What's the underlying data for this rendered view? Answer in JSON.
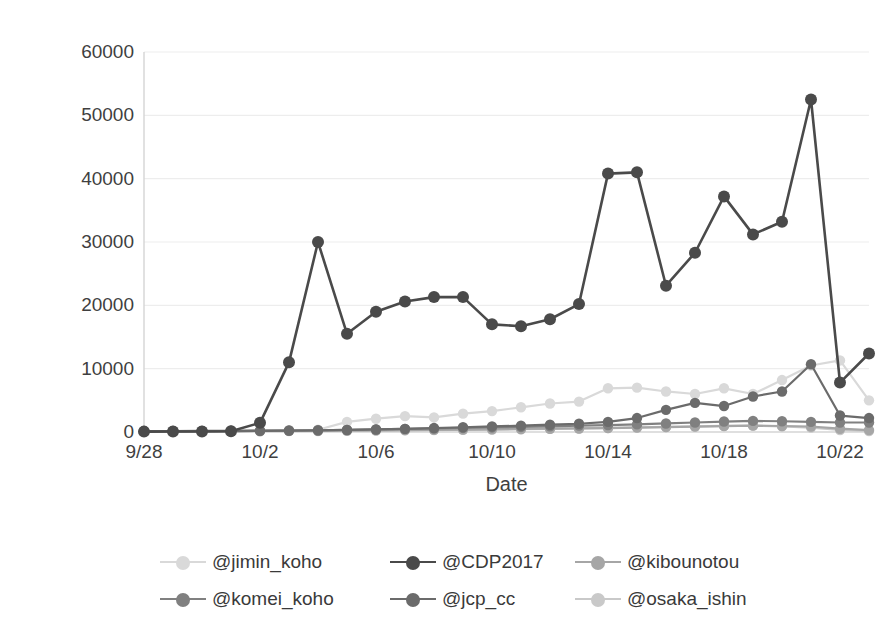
{
  "chart_data": {
    "type": "line",
    "title": "",
    "xlabel": "Date",
    "ylabel": "The number of retweeted",
    "ylim": [
      0,
      60000
    ],
    "ytick_values": [
      0,
      10000,
      20000,
      30000,
      40000,
      50000,
      60000
    ],
    "ytick_labels": [
      "0",
      "10000",
      "20000",
      "30000",
      "40000",
      "50000",
      "60000"
    ],
    "grid": true,
    "grid_axis": "y",
    "legend_position": "bottom",
    "x": [
      "9/28",
      "9/29",
      "9/30",
      "10/1",
      "10/2",
      "10/3",
      "10/4",
      "10/5",
      "10/6",
      "10/7",
      "10/8",
      "10/9",
      "10/10",
      "10/11",
      "10/12",
      "10/13",
      "10/14",
      "10/15",
      "10/16",
      "10/17",
      "10/18",
      "10/19",
      "10/20",
      "10/21",
      "10/22",
      "10/23"
    ],
    "xtick_labels": [
      "9/28",
      "10/2",
      "10/6",
      "10/10",
      "10/14",
      "10/18",
      "10/22"
    ],
    "xtick_indices": [
      0,
      4,
      8,
      12,
      16,
      20,
      24
    ],
    "series": [
      {
        "name": "@jimin_koho",
        "color": "#d9d9d9",
        "values": [
          120,
          150,
          180,
          200,
          260,
          300,
          350,
          1600,
          2100,
          2500,
          2300,
          2900,
          3300,
          3900,
          4500,
          4800,
          6900,
          7000,
          6400,
          6000,
          6900,
          6000,
          8200,
          10500,
          11300,
          5000
        ]
      },
      {
        "name": "@CDP2017",
        "color": "#4a4a4a",
        "values": [
          60,
          70,
          90,
          110,
          1450,
          11000,
          30000,
          15500,
          19000,
          20600,
          21300,
          21300,
          17000,
          16700,
          17800,
          20200,
          40800,
          41000,
          23100,
          28300,
          37200,
          31200,
          33200,
          52500,
          7800,
          12400
        ]
      },
      {
        "name": "@kibounotou",
        "color": "#a6a6a6",
        "values": [
          90,
          100,
          120,
          130,
          160,
          180,
          200,
          230,
          260,
          300,
          340,
          380,
          420,
          470,
          520,
          560,
          620,
          700,
          780,
          860,
          940,
          1000,
          950,
          870,
          520,
          300
        ]
      },
      {
        "name": "@komei_koho",
        "color": "#808080",
        "values": [
          150,
          160,
          170,
          190,
          210,
          240,
          280,
          330,
          400,
          480,
          560,
          640,
          720,
          800,
          900,
          1000,
          1100,
          1200,
          1350,
          1500,
          1650,
          1750,
          1700,
          1600,
          1500,
          1500
        ]
      },
      {
        "name": "@jcp_cc",
        "color": "#6b6b6b",
        "values": [
          100,
          110,
          130,
          150,
          180,
          220,
          260,
          320,
          400,
          500,
          620,
          750,
          880,
          1000,
          1150,
          1300,
          1600,
          2200,
          3500,
          4600,
          4100,
          5600,
          6400,
          10700,
          2600,
          2200
        ]
      },
      {
        "name": "@osaka_ishin",
        "color": "#c9c9c9",
        "values": [
          80,
          85,
          95,
          105,
          120,
          140,
          160,
          190,
          220,
          260,
          300,
          340,
          390,
          440,
          500,
          560,
          640,
          720,
          800,
          880,
          960,
          1000,
          900,
          700,
          320,
          160
        ]
      }
    ]
  },
  "axes": {
    "y_title": "The number of retweeted",
    "x_title": "Date"
  },
  "legend": {
    "items": [
      {
        "label": "@jimin_koho",
        "color": "#d9d9d9"
      },
      {
        "label": "@CDP2017",
        "color": "#4a4a4a"
      },
      {
        "label": "@kibounotou",
        "color": "#a6a6a6"
      },
      {
        "label": "@komei_koho",
        "color": "#808080"
      },
      {
        "label": "@jcp_cc",
        "color": "#6b6b6b"
      },
      {
        "label": "@osaka_ishin",
        "color": "#c9c9c9"
      }
    ]
  },
  "colors": {
    "grid": "#ededed",
    "axis": "#d4d4d4",
    "text": "#3f3f3f",
    "background": "#ffffff"
  }
}
